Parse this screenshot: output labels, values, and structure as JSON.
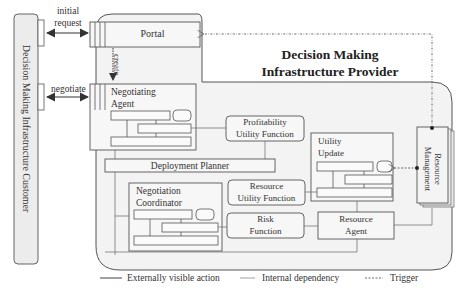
{
  "customer": {
    "label": "Decision Making Infrastructure Customer"
  },
  "provider": {
    "title_line1": "Decision Making",
    "title_line2": "Infrastructure Provider"
  },
  "arrows": {
    "initial_request_line1": "initial",
    "initial_request_line2": "request",
    "negotiate": "negotiate",
    "create": "create"
  },
  "components": {
    "portal": "Portal",
    "negotiating_agent_line1": "Negotiating",
    "negotiating_agent_line2": "Agent",
    "profitability_line1": "Profitability",
    "profitability_line2": "Utility Function",
    "utility_update_line1": "Utility",
    "utility_update_line2": "Update",
    "deployment_planner": "Deployment Planner",
    "negotiation_coordinator_line1": "Negotiation",
    "negotiation_coordinator_line2": "Coordinator",
    "resource_utility_line1": "Resource",
    "resource_utility_line2": "Utility Function",
    "risk_line1": "Risk",
    "risk_line2": "Function",
    "resource_agent_line1": "Resource",
    "resource_agent_line2": "Agent",
    "resource_management": "Resource Management"
  },
  "legend": {
    "externally_visible": "Externally visible action",
    "internal_dependency": "Internal dependency",
    "trigger": "Trigger"
  },
  "colors": {
    "line": "#555555",
    "fill": "#f4f4f4",
    "background": "#ffffff"
  }
}
